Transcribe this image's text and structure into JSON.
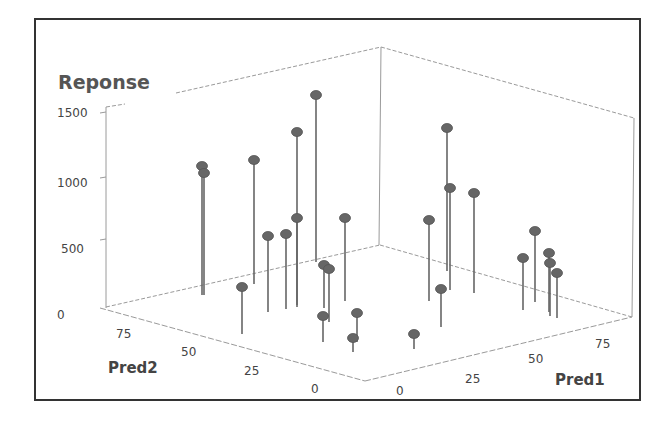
{
  "chart_data": {
    "type": "scatter3d",
    "style": "3D scatter with drop lines (stems) to floor",
    "title": "",
    "zlabel": "Reponse",
    "xlabel": "Pred1",
    "ylabel": "Pred2",
    "z_ticks": [
      "0",
      "500",
      "1000",
      "1500"
    ],
    "x_ticks": [
      "0",
      "25",
      "50",
      "75"
    ],
    "y_ticks": [
      "0",
      "25",
      "50",
      "75"
    ],
    "zlim": [
      0,
      1600
    ],
    "xlim": [
      0,
      90
    ],
    "ylim": [
      0,
      90
    ],
    "grid": false,
    "legend": null,
    "marker_color": "#666666",
    "points": [
      {
        "pred1": 5,
        "pred2": 80,
        "reponse": 1050
      },
      {
        "pred1": 5,
        "pred2": 80,
        "reponse": 1000
      },
      {
        "pred1": 20,
        "pred2": 70,
        "reponse": 1100
      },
      {
        "pred1": 25,
        "pred2": 55,
        "reponse": 1350
      },
      {
        "pred1": 35,
        "pred2": 55,
        "reponse": 1600
      },
      {
        "pred1": 15,
        "pred2": 55,
        "reponse": 500
      },
      {
        "pred1": 20,
        "pred2": 50,
        "reponse": 500
      },
      {
        "pred1": 25,
        "pred2": 50,
        "reponse": 600
      },
      {
        "pred1": 40,
        "pred2": 40,
        "reponse": 550
      },
      {
        "pred1": 5,
        "pred2": 50,
        "reponse": 250
      },
      {
        "pred1": 25,
        "pred2": 25,
        "reponse": 250
      },
      {
        "pred1": 25,
        "pred2": 25,
        "reponse": 250
      },
      {
        "pred1": 20,
        "pred2": 15,
        "reponse": 150
      },
      {
        "pred1": 25,
        "pred2": 10,
        "reponse": 150
      },
      {
        "pred1": 20,
        "pred2": 5,
        "reponse": 100
      },
      {
        "pred1": 30,
        "pred2": 5,
        "reponse": 50
      },
      {
        "pred1": 55,
        "pred2": 65,
        "reponse": 1150
      },
      {
        "pred1": 55,
        "pred2": 60,
        "reponse": 900
      },
      {
        "pred1": 60,
        "pred2": 60,
        "reponse": 700
      },
      {
        "pred1": 45,
        "pred2": 50,
        "reponse": 550
      },
      {
        "pred1": 40,
        "pred2": 25,
        "reponse": 200
      },
      {
        "pred1": 75,
        "pred2": 40,
        "reponse": 450
      },
      {
        "pred1": 75,
        "pred2": 35,
        "reponse": 350
      },
      {
        "pred1": 80,
        "pred2": 35,
        "reponse": 300
      },
      {
        "pred1": 80,
        "pred2": 30,
        "reponse": 250
      },
      {
        "pred1": 85,
        "pred2": 30,
        "reponse": 250
      }
    ],
    "screen_points": [
      {
        "x": 202,
        "y": 166,
        "base": 295
      },
      {
        "x": 204,
        "y": 173,
        "base": 295
      },
      {
        "x": 254,
        "y": 160,
        "base": 284
      },
      {
        "x": 297,
        "y": 132,
        "base": 305
      },
      {
        "x": 316,
        "y": 95,
        "base": 262
      },
      {
        "x": 268,
        "y": 236,
        "base": 312
      },
      {
        "x": 286,
        "y": 234,
        "base": 309
      },
      {
        "x": 297,
        "y": 218,
        "base": 307
      },
      {
        "x": 345,
        "y": 218,
        "base": 301
      },
      {
        "x": 242,
        "y": 287,
        "base": 334
      },
      {
        "x": 324,
        "y": 265,
        "base": 308
      },
      {
        "x": 329,
        "y": 269,
        "base": 322
      },
      {
        "x": 323,
        "y": 316,
        "base": 342
      },
      {
        "x": 357,
        "y": 313,
        "base": 342
      },
      {
        "x": 353,
        "y": 338,
        "base": 352
      },
      {
        "x": 414,
        "y": 334,
        "base": 349
      },
      {
        "x": 447,
        "y": 128,
        "base": 271
      },
      {
        "x": 450,
        "y": 188,
        "base": 290
      },
      {
        "x": 474,
        "y": 193,
        "base": 293
      },
      {
        "x": 429,
        "y": 220,
        "base": 301
      },
      {
        "x": 441,
        "y": 289,
        "base": 327
      },
      {
        "x": 535,
        "y": 231,
        "base": 302
      },
      {
        "x": 523,
        "y": 258,
        "base": 310
      },
      {
        "x": 549,
        "y": 253,
        "base": 312
      },
      {
        "x": 550,
        "y": 263,
        "base": 316
      },
      {
        "x": 557,
        "y": 273,
        "base": 318
      }
    ]
  },
  "labels": {
    "z_title": "Reponse",
    "x_title": "Pred1",
    "y_title": "Pred2",
    "z_ticks": [
      {
        "label": "1500",
        "x": 57,
        "y": 117
      },
      {
        "label": "1000",
        "x": 57,
        "y": 187
      },
      {
        "label": "500",
        "x": 61,
        "y": 253
      },
      {
        "label": "0",
        "x": 57,
        "y": 319
      }
    ],
    "x_ticks": [
      {
        "label": "0",
        "x": 396,
        "y": 395
      },
      {
        "label": "25",
        "x": 465,
        "y": 383
      },
      {
        "label": "50",
        "x": 528,
        "y": 363
      },
      {
        "label": "75",
        "x": 595,
        "y": 348
      }
    ],
    "y_ticks": [
      {
        "label": "75",
        "x": 116,
        "y": 338
      },
      {
        "label": "50",
        "x": 181,
        "y": 356
      },
      {
        "label": "25",
        "x": 244,
        "y": 375
      },
      {
        "label": "0",
        "x": 311,
        "y": 393
      }
    ]
  }
}
